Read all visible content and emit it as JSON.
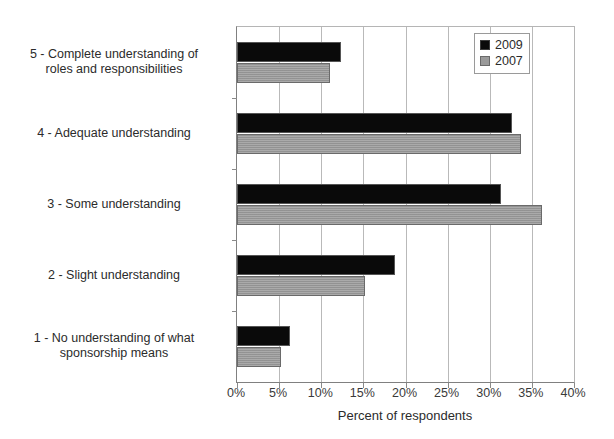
{
  "chart_data": {
    "type": "bar",
    "orientation": "horizontal",
    "title": "",
    "xlabel": "Percent of respondents",
    "ylabel": "",
    "xlim": [
      0,
      40
    ],
    "xticks": [
      "0%",
      "5%",
      "10%",
      "15%",
      "20%",
      "25%",
      "30%",
      "35%",
      "40%"
    ],
    "xtick_values": [
      0,
      5,
      10,
      15,
      20,
      25,
      30,
      35,
      40
    ],
    "grid": true,
    "legend_position": "top-right",
    "categories": [
      "1 - No understanding of what sponsorship means",
      "2 - Slight understanding",
      "3 - Some understanding",
      "4 - Adequate understanding",
      "5 - Complete understanding of roles and responsibilities"
    ],
    "category_lines": [
      [
        "1 - No understanding of what",
        "sponsorship means"
      ],
      [
        "2 - Slight understanding"
      ],
      [
        "3 - Some understanding"
      ],
      [
        "4 - Adequate understanding"
      ],
      [
        "5 - Complete understanding of",
        "roles and responsibilities"
      ]
    ],
    "series": [
      {
        "name": "2009",
        "color": "#0a0a0a",
        "values": [
          6.3,
          18.7,
          31.3,
          32.6,
          12.3
        ]
      },
      {
        "name": "2007",
        "color": "#9a9a9a",
        "values": [
          5.2,
          15.2,
          36.2,
          33.7,
          11.0
        ]
      }
    ]
  },
  "legend": {
    "items": [
      {
        "label": "2009",
        "swatch": "black-square-icon"
      },
      {
        "label": "2007",
        "swatch": "gray-square-icon"
      }
    ]
  },
  "axis": {
    "x_title": "Percent of respondents"
  }
}
